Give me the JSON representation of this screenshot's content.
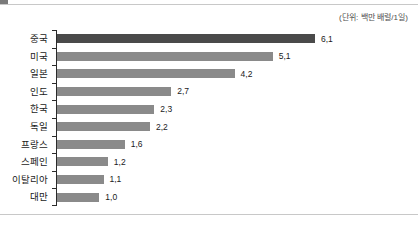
{
  "unit_note": "(단위: 백만 배럴/1일)",
  "colors": {
    "bar_default": "#8a8a8a",
    "bar_highlight": "#4a4a4a",
    "axis": "#2b2b2b",
    "rule": "#c8c8c8",
    "text": "#1a1a1a"
  },
  "chart_data": {
    "type": "bar",
    "orientation": "horizontal",
    "title": "",
    "subtitle": "",
    "xlabel": "",
    "ylabel": "",
    "unit": "백만 배럴/1일",
    "grid": false,
    "legend": null,
    "xlim": [
      0,
      6.1
    ],
    "categories": [
      "중국",
      "미국",
      "일본",
      "인도",
      "한국",
      "독일",
      "프랑스",
      "스페인",
      "이탈리아",
      "대만"
    ],
    "values": [
      6.1,
      5.1,
      4.2,
      2.7,
      2.3,
      2.2,
      1.6,
      1.2,
      1.1,
      1.0
    ],
    "value_labels": [
      "6,1",
      "5,1",
      "4,2",
      "2,7",
      "2,3",
      "2,2",
      "1,6",
      "1,2",
      "1,1",
      "1,0"
    ],
    "highlight_index": 0,
    "annotations": [
      "(단위: 백만 배럴/1일)"
    ]
  }
}
